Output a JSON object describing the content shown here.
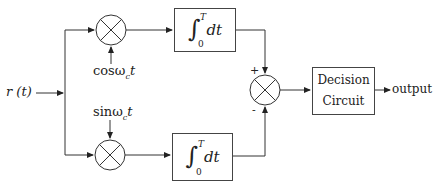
{
  "diagram": {
    "input_label": "r (t)",
    "top_branch": {
      "carrier_label": "cosω",
      "carrier_sub": "c",
      "carrier_suffix": "t",
      "integrator": {
        "symbol": "∫",
        "upper": "T",
        "lower": "0",
        "body": "dt"
      }
    },
    "bottom_branch": {
      "carrier_label": "sinω",
      "carrier_sub": "c",
      "carrier_suffix": "t",
      "integrator": {
        "symbol": "∫",
        "upper": "T",
        "lower": "0",
        "body": "dt"
      }
    },
    "summer": {
      "plus_sign": "+",
      "minus_sign": "-"
    },
    "decision": {
      "line1": "Decision",
      "line2": "Circuit"
    },
    "output_label": "output",
    "colors": {
      "line": "#333333",
      "background": "#ffffff"
    }
  }
}
